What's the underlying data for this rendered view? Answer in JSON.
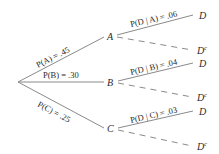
{
  "diagram": {
    "type": "probability-tree",
    "root": {
      "branches": [
        {
          "node": "A",
          "edge_label": "P(A) = .45",
          "children": [
            {
              "node": "D",
              "edge_label": "P(D | A) = .06",
              "style": "solid"
            },
            {
              "node": "D",
              "superscript": "c",
              "edge_label": "",
              "style": "dashed"
            }
          ]
        },
        {
          "node": "B",
          "edge_label": "P(B) = .30",
          "children": [
            {
              "node": "D",
              "edge_label": "P(D | B) = .04",
              "style": "solid"
            },
            {
              "node": "D",
              "superscript": "c",
              "edge_label": "",
              "style": "dashed"
            }
          ]
        },
        {
          "node": "C",
          "edge_label": "P(C) = .25",
          "children": [
            {
              "node": "D",
              "edge_label": "P(D | C) = .03",
              "style": "solid"
            },
            {
              "node": "D",
              "superscript": "c",
              "edge_label": "",
              "style": "dashed"
            }
          ]
        }
      ]
    }
  }
}
